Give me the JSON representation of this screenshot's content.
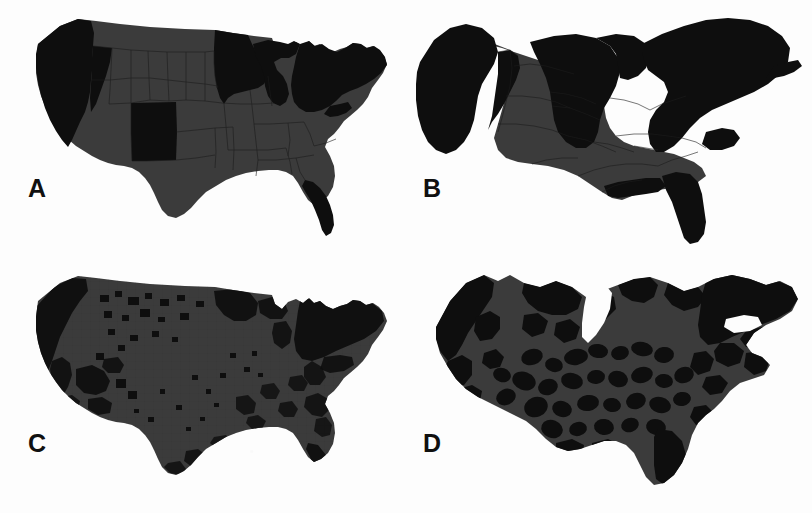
{
  "figure": {
    "background_color": "#fdfdfd",
    "columns": 2,
    "rows": 2
  },
  "palette": {
    "light_fill": "#3b3b3b",
    "dark_fill": "#0e0e0e",
    "border": "#1d1d1d",
    "background": "#fdfdfd",
    "label_color": "#101010"
  },
  "panels": [
    {
      "id": "a",
      "label": "A",
      "map_type": "state-choropleth",
      "geography": "states",
      "description": "Standard equal-area United States state map, states shaded in two tones",
      "dark_regions": [
        "Washington",
        "Oregon",
        "California",
        "Nevada",
        "New Mexico",
        "Minnesota",
        "Wisconsin",
        "Illinois",
        "Michigan",
        "Ohio",
        "Pennsylvania",
        "New York",
        "New Jersey",
        "Maryland",
        "Delaware",
        "Connecticut",
        "Rhode Island",
        "Massachusetts",
        "Vermont",
        "New Hampshire",
        "Maine",
        "Florida"
      ],
      "light_regions": [
        "Idaho",
        "Montana",
        "Wyoming",
        "Utah",
        "Arizona",
        "Colorado",
        "North Dakota",
        "South Dakota",
        "Nebraska",
        "Kansas",
        "Oklahoma",
        "Texas",
        "Iowa",
        "Missouri",
        "Arkansas",
        "Louisiana",
        "Mississippi",
        "Alabama",
        "Georgia",
        "South Carolina",
        "North Carolina",
        "Tennessee",
        "Kentucky",
        "Indiana",
        "West Virginia",
        "Virginia"
      ],
      "borders_visible": true
    },
    {
      "id": "b",
      "label": "B",
      "map_type": "state-cartogram",
      "geography": "states",
      "description": "Population cartogram of states: areas rescaled to population, coastal and northeastern states inflated",
      "dark_regions": [
        "Washington",
        "Oregon",
        "California",
        "Nevada",
        "New Mexico",
        "Minnesota",
        "Wisconsin",
        "Illinois",
        "Michigan",
        "Ohio",
        "Pennsylvania",
        "New York",
        "New Jersey",
        "Maryland",
        "Massachusetts",
        "Maine",
        "Florida"
      ],
      "light_regions": [
        "Idaho",
        "Montana",
        "Wyoming",
        "Utah",
        "Arizona",
        "Colorado",
        "Dakotas",
        "Nebraska",
        "Kansas",
        "Oklahoma",
        "Texas",
        "Iowa",
        "Missouri",
        "Arkansas",
        "Louisiana",
        "Mississippi",
        "Alabama",
        "Georgia",
        "Carolinas",
        "Tennessee",
        "Kentucky",
        "Indiana",
        "Virginia"
      ],
      "borders_visible": true
    },
    {
      "id": "c",
      "label": "C",
      "map_type": "county-choropleth",
      "geography": "counties",
      "description": "Standard equal-area United States county map, speckled dark counties on light ground, dark concentrated along coasts, upper Midwest and Southwest",
      "dark_cluster_areas": [
        "Pacific coast",
        "Upper Midwest",
        "Southwest",
        "Northeast corridor",
        "Mississippi Delta",
        "South Texas",
        "Southern Florida"
      ],
      "borders_visible": true
    },
    {
      "id": "d",
      "label": "D",
      "map_type": "county-cartogram",
      "geography": "counties",
      "description": "Population cartogram of counties: heavily distorted reticulated form, dense dark urban blobs connected by light rural web",
      "dark_cluster_areas": [
        "Pacific coast metros",
        "Northeast megalopolis",
        "Great Lakes metros",
        "Southern Florida",
        "Texas triangle"
      ],
      "borders_visible": true
    }
  ]
}
